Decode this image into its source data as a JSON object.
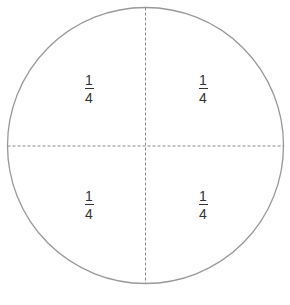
{
  "diagram": {
    "shape": "circle",
    "divisions": 4,
    "stroke_color": "#999999",
    "divider_style": "dashed",
    "sections": [
      {
        "position": "top-left",
        "numerator": "1",
        "denominator": "4"
      },
      {
        "position": "top-right",
        "numerator": "1",
        "denominator": "4"
      },
      {
        "position": "bottom-left",
        "numerator": "1",
        "denominator": "4"
      },
      {
        "position": "bottom-right",
        "numerator": "1",
        "denominator": "4"
      }
    ]
  }
}
